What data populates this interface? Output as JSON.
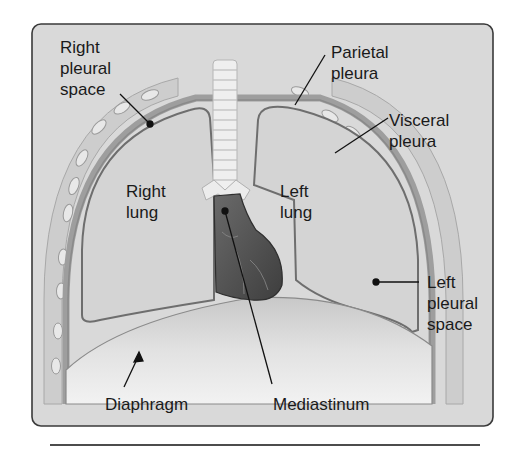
{
  "figure": {
    "colors": {
      "panel_bg": "#d9d9d9",
      "panel_border": "#3a3a3a",
      "rib_wall": "#cfcfcf",
      "rib_oval": "#e6e6e6",
      "pleura_line": "#7a7a7a",
      "lung_fill": "#d2d2d2",
      "heart": "#5a5a5a",
      "trachea": "#f0f0f0",
      "diaphragm": "#e9e9e9",
      "label_text": "#1a1a1a",
      "leader_line": "#111111"
    }
  },
  "labels": {
    "right_pleural_space": [
      "Right",
      "pleural",
      "space"
    ],
    "parietal_pleura": [
      "Parietal",
      "pleura"
    ],
    "visceral_pleura": [
      "Visceral",
      "pleura"
    ],
    "right_lung": [
      "Right",
      "lung"
    ],
    "left_lung": [
      "Left",
      "lung"
    ],
    "left_pleural_space": [
      "Left",
      "pleural",
      "space"
    ],
    "diaphragm": "Diaphragm",
    "mediastinum": "Mediastinum"
  }
}
